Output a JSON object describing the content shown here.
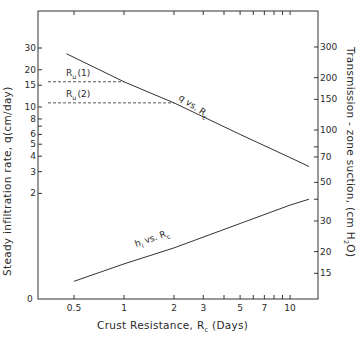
{
  "chart_data": {
    "type": "line",
    "title": "",
    "xlabel": "Crust Resistance, R_c (Days)",
    "xlabel_main": "Crust Resistance, R",
    "xlabel_sub": "c",
    "xlabel_tail": " (Days)",
    "xscale": "log",
    "xlim": [
      0.35,
      15
    ],
    "x_ticks": [
      {
        "value": 0.5,
        "label": "0.5"
      },
      {
        "value": 1,
        "label": "1"
      },
      {
        "value": 2,
        "label": "2"
      },
      {
        "value": 3,
        "label": "3"
      },
      {
        "value": 4,
        "label": ""
      },
      {
        "value": 5,
        "label": "5"
      },
      {
        "value": 6,
        "label": ""
      },
      {
        "value": 7,
        "label": "7"
      },
      {
        "value": 8,
        "label": ""
      },
      {
        "value": 9,
        "label": ""
      },
      {
        "value": 10,
        "label": "10"
      }
    ],
    "ylabel_left": "Steady infiltration rate, q(cm/day)",
    "yscale_left": "log",
    "y_ticks_left": [
      {
        "value": 2,
        "label": "2"
      },
      {
        "value": 3,
        "label": "3"
      },
      {
        "value": 4,
        "label": "4"
      },
      {
        "value": 5,
        "label": "5"
      },
      {
        "value": 6,
        "label": "6"
      },
      {
        "value": 7,
        "label": ""
      },
      {
        "value": 8,
        "label": "8"
      },
      {
        "value": 10,
        "label": "10"
      },
      {
        "value": 15,
        "label": "15"
      },
      {
        "value": 20,
        "label": "20"
      },
      {
        "value": 30,
        "label": "30"
      }
    ],
    "origin_label": "0",
    "ylabel_right": "Transmission - zone suction, (cm H2O)",
    "ylabel_right_main": "Transmission - zone suction, (cm H",
    "ylabel_right_sub": "2",
    "ylabel_right_tail": "O)",
    "yscale_right": "log",
    "y_ticks_right": [
      {
        "value": 15,
        "label": "15"
      },
      {
        "value": 20,
        "label": "20"
      },
      {
        "value": 30,
        "label": "30"
      },
      {
        "value": 40,
        "label": ""
      },
      {
        "value": 50,
        "label": "50"
      },
      {
        "value": 70,
        "label": "70"
      },
      {
        "value": 80,
        "label": ""
      },
      {
        "value": 100,
        "label": "100"
      },
      {
        "value": 150,
        "label": "150"
      },
      {
        "value": 200,
        "label": "200"
      },
      {
        "value": 300,
        "label": "300"
      }
    ],
    "grid": false,
    "series": [
      {
        "name": "q vs. R_c",
        "label": "q vs. R",
        "label_sub": "c",
        "axis": "left",
        "x": [
          0.45,
          1,
          2,
          5,
          10,
          13
        ],
        "values": [
          27,
          16,
          10.8,
          6.0,
          3.9,
          3.3
        ]
      },
      {
        "name": "h_i vs. R_c",
        "label": "h",
        "label_sub": "i",
        "label_tail": " vs. R",
        "label_tail_sub": "c",
        "axis": "right",
        "x": [
          0.5,
          1,
          2,
          5,
          10,
          13
        ],
        "values": [
          13.5,
          17,
          21,
          29,
          37,
          40
        ]
      }
    ],
    "annotations": [
      {
        "text": "R_u(1)",
        "main": "R",
        "sub": "u",
        "tail": "(1)",
        "type": "dashed-hline",
        "y_left": 16,
        "x_end": 1
      },
      {
        "text": "R_u(2)",
        "main": "R",
        "sub": "u",
        "tail": "(2)",
        "type": "dashed-hline",
        "y_left": 10.8,
        "x_end": 2
      }
    ]
  }
}
